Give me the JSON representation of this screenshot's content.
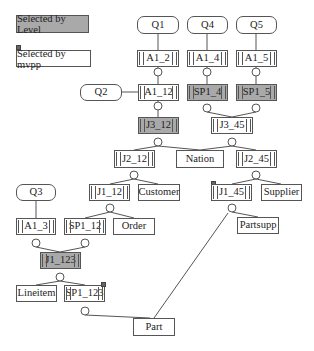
{
  "legend": {
    "selected_by_level": "Selected by Level",
    "selected_by_mvpp": "Selected by mvpp"
  },
  "colors": {
    "level_fill": "#a9a9a9",
    "line": "#555555",
    "mvpp_marker": "#666666"
  },
  "nodes": {
    "q1": "Q1",
    "q4": "Q4",
    "q5": "Q5",
    "q2": "Q2",
    "q3": "Q3",
    "a1_2": "A1_2",
    "a1_4": "A1_4",
    "a1_5": "A1_5",
    "a1_12": "A1_12",
    "sp1_4": "SP1_4",
    "sp1_5": "SP1_5",
    "j3_12": "J3_12",
    "j3_45": "J3_45",
    "j2_12": "J2_12",
    "nation": "Nation",
    "j2_45": "J2_45",
    "j1_12": "J1_12",
    "customer": "Customer",
    "j1_45": "J1_45",
    "supplier": "Supplier",
    "a1_3": "A1_3",
    "sp1_12": "SP1_12",
    "order": "Order",
    "partsupp": "Partsupp",
    "j1_123": "J1_123",
    "lineitem": "Lineitem",
    "sp1_123": "SP1_123",
    "part": "Part"
  }
}
